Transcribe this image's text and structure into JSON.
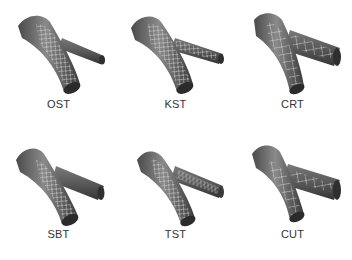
{
  "figure": {
    "panels": [
      {
        "id": "ost",
        "label": "OST",
        "stent_in": "main-and-distal"
      },
      {
        "id": "kst",
        "label": "KST",
        "stent_in": "main-and-side-branch"
      },
      {
        "id": "crt",
        "label": "CRT",
        "stent_in": "main-and-side-branch-crush"
      },
      {
        "id": "sbt",
        "label": "SBT",
        "stent_in": "main-branch"
      },
      {
        "id": "tst",
        "label": "TST",
        "stent_in": "main-and-side-branch-t"
      },
      {
        "id": "cut",
        "label": "CUT",
        "stent_in": "main-and-side-branch-culotte"
      }
    ],
    "colors": {
      "vessel": "#6e6e6e",
      "vessel_dark": "#3c3c3c",
      "strut": "#d8d8d8",
      "label": "#333333",
      "background": "#ffffff"
    }
  }
}
